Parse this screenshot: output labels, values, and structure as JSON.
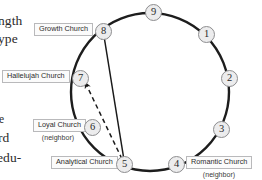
{
  "document_fragments": [
    {
      "id": "frag-1",
      "text": "ngth"
    },
    {
      "id": "frag-2",
      "text": "ype"
    },
    {
      "id": "frag-3",
      "text": "e"
    },
    {
      "id": "frag-4",
      "text": "rd"
    },
    {
      "id": "frag-5",
      "text": "edu-"
    }
  ],
  "diagram": {
    "type": "enneagram-circle",
    "circle": {
      "cx": 150,
      "cy": 92,
      "r": 79,
      "stroke": "#1d1d1d",
      "stroke_width": 2.4
    },
    "nodes": [
      {
        "number": "1",
        "x": 198,
        "y": 26,
        "label": null
      },
      {
        "number": "2",
        "x": 221,
        "y": 70,
        "label": null
      },
      {
        "number": "3",
        "x": 213,
        "y": 121,
        "label": null
      },
      {
        "number": "4",
        "x": 168,
        "y": 159,
        "label": "Romantic Church",
        "sublabel": "(neighbor)",
        "label_side": "right"
      },
      {
        "number": "5",
        "x": 116,
        "y": 159,
        "label": "Analytical Church",
        "sublabel": null,
        "label_side": "left"
      },
      {
        "number": "6",
        "x": 84,
        "y": 122,
        "label": "Loyal Church",
        "sublabel": "(neighbor)",
        "label_side": "left"
      },
      {
        "number": "7",
        "x": 72,
        "y": 73,
        "label": "Hallelujah Church",
        "sublabel": null,
        "label_side": "left"
      },
      {
        "number": "8",
        "x": 95,
        "y": 25,
        "label": "Growth Church",
        "sublabel": null,
        "label_side": "left"
      },
      {
        "number": "9",
        "x": 145,
        "y": 5,
        "label": null
      }
    ],
    "arrows": [
      {
        "id": "arrow-solid-5-to-8",
        "from": "5",
        "to": "8",
        "style": "solid",
        "color": "#1a1a1a"
      },
      {
        "id": "arrow-dashed-5-to-7",
        "from": "5",
        "to": "7",
        "style": "dashed",
        "color": "#1a1a1a"
      }
    ],
    "colors": {
      "circle_stroke": "#1d1d1d",
      "node_fill": "#ececed",
      "node_stroke": "#8d8d8f",
      "label_border": "#b9b9bb",
      "label_fill": "#fbfbfb",
      "text": "#2a2a2a"
    }
  }
}
